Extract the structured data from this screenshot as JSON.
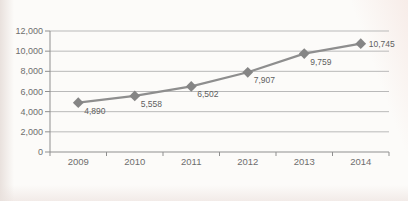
{
  "chart_data": {
    "type": "line",
    "title": "",
    "categories": [
      "2009",
      "2010",
      "2011",
      "2012",
      "2013",
      "2014"
    ],
    "series": [
      {
        "name": "series-1",
        "values": [
          4890,
          5558,
          6502,
          7907,
          9759,
          10745
        ]
      }
    ],
    "point_labels": [
      "4,890",
      "5,558",
      "6,502",
      "7,907",
      "9,759",
      "10,745"
    ],
    "xlabel": "",
    "ylabel": "",
    "ylim": [
      0,
      12000
    ],
    "y_ticks": [
      0,
      2000,
      4000,
      6000,
      8000,
      10000,
      12000
    ],
    "y_tick_labels": [
      "0",
      "2,000",
      "4,000",
      "6,000",
      "8,000",
      "10,000",
      "12,000"
    ],
    "grid": true,
    "legend": false,
    "marker": "diamond",
    "colors": {
      "line": "#8e8e8e",
      "marker": "#858585",
      "grid": "#b9b9b9",
      "axis": "#8f8f8f",
      "tick_label": "#6e6e6e",
      "point_label": "#5f5f5f",
      "background": "#fcfbf9"
    }
  }
}
